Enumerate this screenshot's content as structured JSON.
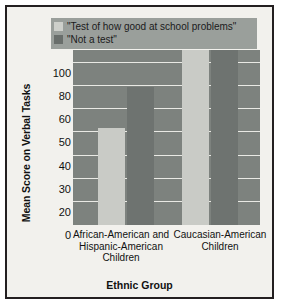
{
  "figure": {
    "legend": [
      {
        "label": "\"Test of how good at school problems\"",
        "swatch": "light",
        "color": "#cdcfca"
      },
      {
        "label": "\"Not a test\"",
        "swatch": "dark",
        "color": "#696e6b"
      }
    ]
  },
  "chart_data": {
    "type": "bar",
    "title": "",
    "xlabel": "Ethnic Group",
    "ylabel": "Mean Score on Verbal Tasks",
    "categories": [
      "African-American and Hispanic-American Children",
      "Caucasian-American Children"
    ],
    "category_lines": [
      [
        "African-American and",
        "Hispanic-American",
        "Children"
      ],
      [
        "Caucasian-American",
        "Children"
      ]
    ],
    "series": [
      {
        "name": "\"Test of how good at school problems\"",
        "color": "#c9cbc6",
        "values": [
          60,
          108
        ]
      },
      {
        "name": "\"Not a test\"",
        "color": "#6e7370",
        "values": [
          85,
          108
        ]
      }
    ],
    "ytick_labels": [
      "0",
      "20",
      "30",
      "40",
      "50",
      "60",
      "80",
      "100"
    ],
    "ytick_values": [
      0,
      20,
      30,
      40,
      50,
      60,
      80,
      100
    ],
    "ylim": [
      0,
      108
    ],
    "grid": true,
    "legend_position": "top",
    "plot_background": "#7d827e",
    "gridline_color": "#e9e9e4"
  }
}
